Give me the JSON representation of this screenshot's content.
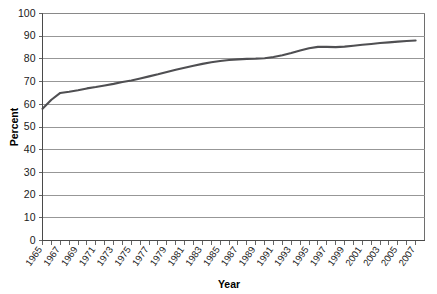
{
  "chart_data": {
    "type": "line",
    "title": "",
    "xlabel": "Year",
    "ylabel": "Percent",
    "ylim": [
      0,
      100
    ],
    "xlim": [
      1965,
      2008
    ],
    "ytick_step": 10,
    "grid": true,
    "legend": "none",
    "yticks": [
      0,
      10,
      20,
      30,
      40,
      50,
      60,
      70,
      80,
      90,
      100
    ],
    "xticks": [
      1965,
      1966,
      1967,
      1968,
      1969,
      1970,
      1971,
      1972,
      1973,
      1974,
      1975,
      1976,
      1977,
      1978,
      1979,
      1980,
      1981,
      1982,
      1983,
      1984,
      1985,
      1986,
      1987,
      1988,
      1989,
      1990,
      1991,
      1992,
      1993,
      1994,
      1995,
      1996,
      1997,
      1998,
      1999,
      2000,
      2001,
      2002,
      2003,
      2004,
      2005,
      2006,
      2007
    ],
    "xtick_labels": [
      "1965",
      "1967",
      "1969",
      "1971",
      "1973",
      "1975",
      "1977",
      "1979",
      "1981",
      "1983",
      "1985",
      "1987",
      "1989",
      "1991",
      "1993",
      "1995",
      "1997",
      "1999",
      "2001",
      "2003",
      "2005",
      "2007"
    ],
    "xtick_label_years": [
      1965,
      1967,
      1969,
      1971,
      1973,
      1975,
      1977,
      1979,
      1981,
      1983,
      1985,
      1987,
      1989,
      1991,
      1993,
      1995,
      1997,
      1999,
      2001,
      2003,
      2005,
      2007
    ],
    "series": [
      {
        "name": "Percent",
        "color": "#4f4f52",
        "x": [
          1965,
          1966,
          1967,
          1968,
          1969,
          1970,
          1971,
          1972,
          1973,
          1974,
          1975,
          1976,
          1977,
          1978,
          1979,
          1980,
          1981,
          1982,
          1983,
          1984,
          1985,
          1986,
          1987,
          1988,
          1989,
          1990,
          1991,
          1992,
          1993,
          1994,
          1995,
          1996,
          1997,
          1998,
          1999,
          2000,
          2001,
          2002,
          2003,
          2004,
          2005,
          2006,
          2007
        ],
        "values": [
          58.0,
          62.0,
          65.0,
          65.5,
          66.2,
          67.0,
          67.6,
          68.3,
          69.0,
          69.8,
          70.5,
          71.4,
          72.3,
          73.2,
          74.2,
          75.2,
          76.1,
          77.0,
          77.8,
          78.5,
          79.1,
          79.5,
          79.8,
          80.0,
          80.1,
          80.3,
          80.8,
          81.6,
          82.6,
          83.7,
          84.7,
          85.3,
          85.3,
          85.2,
          85.4,
          85.8,
          86.2,
          86.6,
          87.0,
          87.3,
          87.6,
          87.9,
          88.1
        ]
      }
    ]
  },
  "axis_titles": {
    "x": "Year",
    "y": "Percent"
  },
  "colors": {
    "series": "#4f4f52",
    "grid": "#8c8c8c",
    "frame": "#6e6e6e",
    "text": "#1a1a1a",
    "background": "#ffffff"
  }
}
